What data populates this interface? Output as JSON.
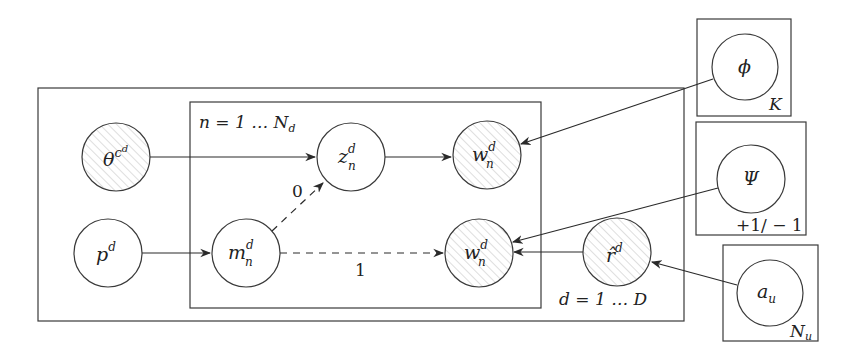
{
  "diagram": {
    "type": "graphical-model (plate notation)",
    "colors": {
      "stroke": "#3a3a3a",
      "observed_hatch": "#bdbdbd",
      "background": "#ffffff"
    },
    "plates": {
      "outer": {
        "label": "d = 1 … D"
      },
      "inner": {
        "label": "n = 1 … N",
        "label_sub": "d"
      },
      "phi": {
        "label": "K"
      },
      "psi": {
        "label": "+1/ − 1"
      },
      "au": {
        "label": "N",
        "label_sub": "u"
      }
    },
    "nodes": {
      "theta": {
        "base": "θ",
        "sup": "c",
        "supsup": "d",
        "observed": true
      },
      "p": {
        "base": "p",
        "sup": "d",
        "observed": false
      },
      "z": {
        "base": "z",
        "sup": "d",
        "sub": "n",
        "observed": false
      },
      "m": {
        "base": "m",
        "sup": "d",
        "sub": "n",
        "observed": false
      },
      "w_top": {
        "base": "w",
        "sup": "d",
        "sub": "n",
        "observed": true
      },
      "w_bot": {
        "base": "w",
        "sup": "d",
        "sub": "n",
        "observed": true
      },
      "rhat": {
        "base": "r̂",
        "sup": "d",
        "observed": true
      },
      "phi": {
        "base": "ϕ",
        "observed": false
      },
      "psi": {
        "base": "Ψ",
        "observed": false
      },
      "au": {
        "base": "a",
        "sub": "u",
        "observed": false
      }
    },
    "edges": [
      {
        "from": "theta",
        "to": "z",
        "style": "solid"
      },
      {
        "from": "z",
        "to": "w_top",
        "style": "solid"
      },
      {
        "from": "p",
        "to": "m",
        "style": "solid"
      },
      {
        "from": "m",
        "to": "z",
        "style": "dashed",
        "label": "0"
      },
      {
        "from": "m",
        "to": "w_bot",
        "style": "dashed",
        "label": "1"
      },
      {
        "from": "phi",
        "to": "w_top",
        "style": "solid"
      },
      {
        "from": "psi",
        "to": "w_bot",
        "style": "solid"
      },
      {
        "from": "rhat",
        "to": "w_bot",
        "style": "solid"
      },
      {
        "from": "au",
        "to": "rhat",
        "style": "solid"
      }
    ],
    "edge_labels": {
      "m_to_z": "0",
      "m_to_w": "1"
    }
  }
}
